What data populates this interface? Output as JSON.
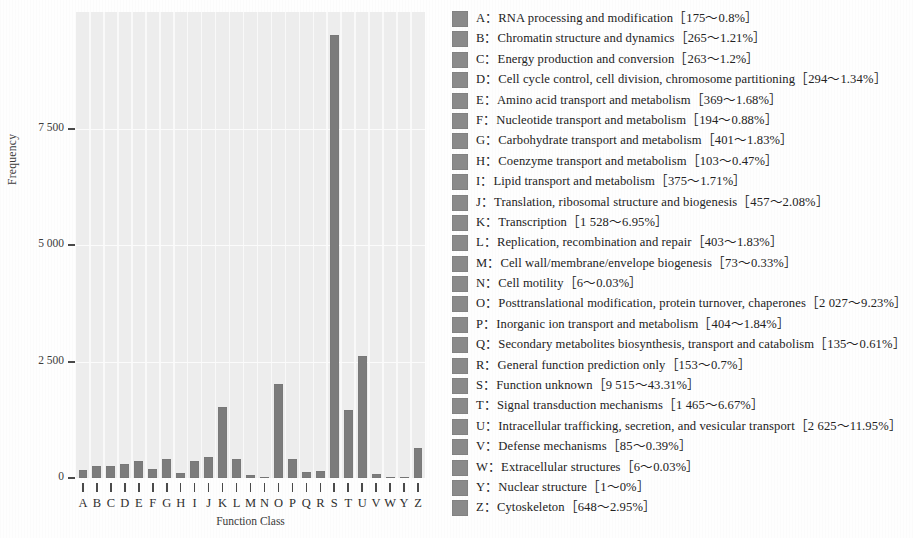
{
  "chart_data": {
    "type": "bar",
    "title": "",
    "xlabel": "Function Class",
    "ylabel": "Frequency",
    "ylim": [
      0,
      10000
    ],
    "yticks": [
      0,
      2500,
      5000,
      7500
    ],
    "ytick_labels": [
      "0",
      "2 500",
      "5 000",
      "7 500"
    ],
    "grid": true,
    "legend_position": "right",
    "bar_color": "#7c7c7c",
    "plot_background": "#ededed",
    "categories": [
      "A",
      "B",
      "C",
      "D",
      "E",
      "F",
      "G",
      "H",
      "I",
      "J",
      "K",
      "L",
      "M",
      "N",
      "O",
      "P",
      "Q",
      "R",
      "S",
      "T",
      "U",
      "V",
      "W",
      "Y",
      "Z"
    ],
    "values": [
      175,
      265,
      263,
      294,
      369,
      194,
      401,
      103,
      375,
      457,
      1528,
      403,
      73,
      6,
      2027,
      404,
      135,
      153,
      9515,
      1465,
      2625,
      85,
      6,
      1,
      648
    ],
    "percentages": [
      "0.8%",
      "1.21%",
      "1.2%",
      "1.34%",
      "1.68%",
      "0.88%",
      "1.83%",
      "0.47%",
      "1.71%",
      "2.08%",
      "6.95%",
      "1.83%",
      "0.33%",
      "0.03%",
      "9.23%",
      "1.84%",
      "0.61%",
      "0.7%",
      "43.31%",
      "6.67%",
      "11.95%",
      "0.39%",
      "0.03%",
      "0%",
      "2.95%"
    ]
  },
  "axes": {
    "y_title": "Frequency",
    "x_title": "Function Class",
    "y_tick_labels": [
      "7 500",
      "5 000",
      "2 500",
      "0"
    ],
    "x_tick_labels": [
      "A",
      "B",
      "C",
      "D",
      "E",
      "F",
      "G",
      "H",
      "I",
      "J",
      "K",
      "L",
      "M",
      "N",
      "O",
      "P",
      "Q",
      "R",
      "S",
      "T",
      "U",
      "V",
      "W",
      "Y",
      "Z"
    ]
  },
  "legend": {
    "items": [
      {
        "key": "A",
        "label": "RNA processing and modification",
        "count": "175",
        "percent": "0.8%",
        "text": "A：RNA processing and modification［175～0.8%］"
      },
      {
        "key": "B",
        "label": "Chromatin structure and dynamics",
        "count": "265",
        "percent": "1.21%",
        "text": "B：Chromatin structure and dynamics［265～1.21%］"
      },
      {
        "key": "C",
        "label": "Energy production and conversion",
        "count": "263",
        "percent": "1.2%",
        "text": "C：Energy production and conversion［263～1.2%］"
      },
      {
        "key": "D",
        "label": "Cell cycle control, cell division, chromosome partitioning",
        "count": "294",
        "percent": "1.34%",
        "text": "D：Cell cycle control, cell division, chromosome partitioning［294～1.34%］"
      },
      {
        "key": "E",
        "label": "Amino acid transport and metabolism",
        "count": "369",
        "percent": "1.68%",
        "text": "E：Amino acid transport and metabolism［369～1.68%］"
      },
      {
        "key": "F",
        "label": "Nucleotide transport and metabolism",
        "count": "194",
        "percent": "0.88%",
        "text": "F：Nucleotide transport and metabolism［194～0.88%］"
      },
      {
        "key": "G",
        "label": "Carbohydrate transport and metabolism",
        "count": "401",
        "percent": "1.83%",
        "text": "G：Carbohydrate transport and metabolism［401～1.83%］"
      },
      {
        "key": "H",
        "label": "Coenzyme transport and metabolism",
        "count": "103",
        "percent": "0.47%",
        "text": "H：Coenzyme transport and metabolism［103～0.47%］"
      },
      {
        "key": "I",
        "label": "Lipid transport and metabolism",
        "count": "375",
        "percent": "1.71%",
        "text": "I：Lipid transport and metabolism［375～1.71%］"
      },
      {
        "key": "J",
        "label": "Translation, ribosomal structure and biogenesis",
        "count": "457",
        "percent": "2.08%",
        "text": "J：Translation, ribosomal structure and biogenesis［457～2.08%］"
      },
      {
        "key": "K",
        "label": "Transcription",
        "count": "1 528",
        "percent": "6.95%",
        "text": "K：Transcription［1 528～6.95%］"
      },
      {
        "key": "L",
        "label": "Replication, recombination and repair",
        "count": "403",
        "percent": "1.83%",
        "text": "L：Replication, recombination and repair［403～1.83%］"
      },
      {
        "key": "M",
        "label": "Cell wall/membrane/envelope biogenesis",
        "count": "73",
        "percent": "0.33%",
        "text": "M：Cell wall/membrane/envelope biogenesis［73～0.33%］"
      },
      {
        "key": "N",
        "label": "Cell motility",
        "count": "6",
        "percent": "0.03%",
        "text": "N：Cell motility［6～0.03%］"
      },
      {
        "key": "O",
        "label": "Posttranslational modification, protein turnover, chaperones",
        "count": "2 027",
        "percent": "9.23%",
        "text": "O：Posttranslational modification, protein turnover, chaperones［2 027～9.23%］"
      },
      {
        "key": "P",
        "label": "Inorganic ion transport and metabolism",
        "count": "404",
        "percent": "1.84%",
        "text": "P：Inorganic ion transport and metabolism［404～1.84%］"
      },
      {
        "key": "Q",
        "label": "Secondary metabolites biosynthesis, transport and catabolism",
        "count": "135",
        "percent": "0.61%",
        "text": "Q：Secondary metabolites biosynthesis, transport and catabolism［135～0.61%］"
      },
      {
        "key": "R",
        "label": "General function prediction only",
        "count": "153",
        "percent": "0.7%",
        "text": "R：General function prediction only［153～0.7%］"
      },
      {
        "key": "S",
        "label": "Function unknown",
        "count": "9 515",
        "percent": "43.31%",
        "text": "S：Function unknown［9 515～43.31%］"
      },
      {
        "key": "T",
        "label": "Signal transduction mechanisms",
        "count": "1 465",
        "percent": "6.67%",
        "text": "T：Signal transduction mechanisms［1 465～6.67%］"
      },
      {
        "key": "U",
        "label": "Intracellular trafficking, secretion, and vesicular transport",
        "count": "2 625",
        "percent": "11.95%",
        "text": "U：Intracellular trafficking, secretion, and vesicular transport［2 625～11.95%］"
      },
      {
        "key": "V",
        "label": "Defense mechanisms",
        "count": "85",
        "percent": "0.39%",
        "text": "V：Defense mechanisms［85～0.39%］"
      },
      {
        "key": "W",
        "label": "Extracellular structures",
        "count": "6",
        "percent": "0.03%",
        "text": "W：Extracellular structures［6～0.03%］"
      },
      {
        "key": "Y",
        "label": "Nuclear structure",
        "count": "1",
        "percent": "0%",
        "text": "Y：Nuclear structure［1～0%］"
      },
      {
        "key": "Z",
        "label": "Cytoskeleton",
        "count": "648",
        "percent": "2.95%",
        "text": "Z：Cytoskeleton［648～2.95%］"
      }
    ]
  }
}
